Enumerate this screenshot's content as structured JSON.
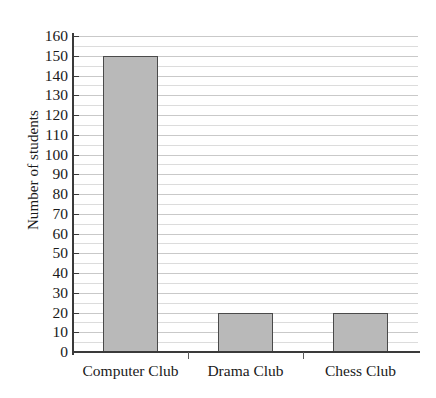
{
  "chart_data": {
    "type": "bar",
    "title": "",
    "xlabel": "",
    "ylabel": "Number of students",
    "categories": [
      "Computer Club",
      "Drama Club",
      "Chess Club"
    ],
    "values": [
      150,
      20,
      20
    ],
    "ylim": [
      0,
      160
    ],
    "ytick_step": 10,
    "yminor_step": 5,
    "ytick_labels": [
      "0",
      "10",
      "20",
      "30",
      "40",
      "50",
      "60",
      "70",
      "80",
      "90",
      "100",
      "110",
      "120",
      "130",
      "140",
      "150",
      "160"
    ],
    "grid": "horizontal",
    "legend": "none",
    "bar_fill_color": "#b9b9b9",
    "bar_border_color": "#4a4a4a",
    "axis_color": "#3a3a3a",
    "gridline_color": "#dcdcdc",
    "background_color": "#ffffff"
  }
}
